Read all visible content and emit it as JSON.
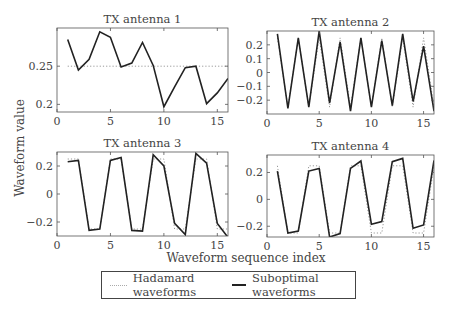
{
  "figure": {
    "ylabel": "Waveform value",
    "xlabel": "Waveform sequence index"
  },
  "legend": {
    "items": [
      {
        "label": "Hadamard waveforms",
        "style": "dotted",
        "color": "#aaaaaa"
      },
      {
        "label": "Suboptimal waveforms",
        "style": "solid",
        "color": "#222222"
      }
    ]
  },
  "chart_data": [
    {
      "type": "line",
      "title": "TX antenna 1",
      "x": [
        1,
        2,
        3,
        4,
        5,
        6,
        7,
        8,
        9,
        10,
        11,
        12,
        13,
        14,
        15,
        16
      ],
      "series": [
        {
          "name": "Hadamard waveforms",
          "values": [
            0.25,
            0.25,
            0.25,
            0.25,
            0.25,
            0.25,
            0.25,
            0.25,
            0.25,
            0.25,
            0.25,
            0.25,
            0.25,
            0.25,
            0.25,
            0.25
          ]
        },
        {
          "name": "Suboptimal waveforms",
          "values": [
            0.285,
            0.245,
            0.259,
            0.295,
            0.288,
            0.249,
            0.254,
            0.281,
            0.251,
            0.197,
            0.223,
            0.248,
            0.25,
            0.201,
            0.215,
            0.234
          ]
        }
      ],
      "xlim": [
        0,
        16
      ],
      "ylim": [
        0.19,
        0.3
      ],
      "xticks": [
        0,
        5,
        10,
        15
      ],
      "yticks": [
        0.2,
        0.25
      ],
      "ytick_labels": [
        "0.2",
        "0.25"
      ]
    },
    {
      "type": "line",
      "title": "TX antenna 2",
      "x": [
        1,
        2,
        3,
        4,
        5,
        6,
        7,
        8,
        9,
        10,
        11,
        12,
        13,
        14,
        15,
        16
      ],
      "series": [
        {
          "name": "Hadamard waveforms",
          "values": [
            0.25,
            -0.25,
            0.25,
            -0.25,
            0.25,
            -0.25,
            0.25,
            -0.25,
            0.25,
            -0.25,
            0.25,
            -0.25,
            0.25,
            -0.25,
            0.25,
            -0.25
          ]
        },
        {
          "name": "Suboptimal waveforms",
          "values": [
            0.28,
            -0.26,
            0.25,
            -0.25,
            0.3,
            -0.22,
            0.22,
            -0.28,
            0.25,
            -0.25,
            0.23,
            -0.24,
            0.28,
            -0.21,
            0.19,
            -0.28
          ]
        }
      ],
      "xlim": [
        0,
        16
      ],
      "ylim": [
        -0.3,
        0.3
      ],
      "xticks": [
        0,
        5,
        10,
        15
      ],
      "yticks": [
        -0.2,
        -0.1,
        0,
        0.1,
        0.2
      ],
      "ytick_labels": [
        "−0.2",
        "−0.1",
        "0",
        "0.1",
        "0.2"
      ]
    },
    {
      "type": "line",
      "title": "TX antenna 3",
      "x": [
        1,
        2,
        3,
        4,
        5,
        6,
        7,
        8,
        9,
        10,
        11,
        12,
        13,
        14,
        15,
        16
      ],
      "series": [
        {
          "name": "Hadamard waveforms",
          "values": [
            0.25,
            0.25,
            -0.25,
            -0.25,
            0.25,
            0.25,
            -0.25,
            -0.25,
            0.25,
            0.25,
            -0.25,
            -0.25,
            0.25,
            0.25,
            -0.25,
            -0.25
          ]
        },
        {
          "name": "Suboptimal waveforms",
          "values": [
            0.23,
            0.24,
            -0.26,
            -0.25,
            0.24,
            0.26,
            -0.26,
            -0.265,
            0.28,
            0.2,
            -0.21,
            -0.29,
            0.29,
            0.22,
            -0.21,
            -0.31
          ]
        }
      ],
      "xlim": [
        0,
        16
      ],
      "ylim": [
        -0.3,
        0.3
      ],
      "xticks": [
        0,
        5,
        10,
        15
      ],
      "yticks": [
        -0.2,
        0,
        0.2
      ],
      "ytick_labels": [
        "−0.2",
        "0",
        "0.2"
      ]
    },
    {
      "type": "line",
      "title": "TX antenna 4",
      "x": [
        1,
        2,
        3,
        4,
        5,
        6,
        7,
        8,
        9,
        10,
        11,
        12,
        13,
        14,
        15,
        16
      ],
      "series": [
        {
          "name": "Hadamard waveforms",
          "values": [
            0.25,
            -0.25,
            -0.25,
            0.25,
            0.25,
            -0.25,
            -0.25,
            0.25,
            0.25,
            -0.25,
            -0.25,
            0.25,
            0.25,
            -0.25,
            -0.25,
            0.25
          ]
        },
        {
          "name": "Suboptimal waveforms",
          "values": [
            0.21,
            -0.25,
            -0.235,
            0.21,
            0.23,
            -0.28,
            -0.255,
            0.23,
            0.285,
            -0.185,
            -0.165,
            0.28,
            0.305,
            -0.215,
            -0.19,
            0.29
          ]
        }
      ],
      "xlim": [
        0,
        16
      ],
      "ylim": [
        -0.28,
        0.33
      ],
      "xticks": [
        0,
        5,
        10,
        15
      ],
      "yticks": [
        -0.2,
        0,
        0.2
      ],
      "ytick_labels": [
        "−0.2",
        "0",
        "0.2"
      ]
    }
  ]
}
